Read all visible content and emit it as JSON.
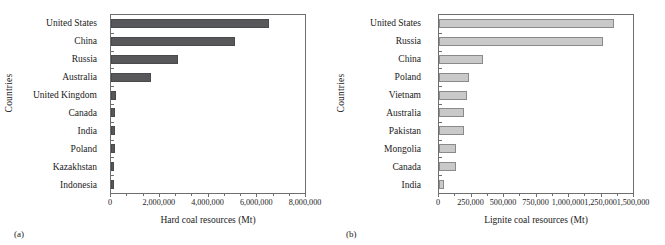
{
  "figure": {
    "panels": [
      {
        "tag": "(a)",
        "ylabel": "Countries",
        "xlabel": "Hard coal resources (Mt)"
      },
      {
        "tag": "(b)",
        "ylabel": "Countries",
        "xlabel": "Lignite coal resources (Mt)"
      }
    ]
  },
  "chart_data": [
    {
      "type": "bar",
      "orientation": "horizontal",
      "title": "",
      "xlabel": "Hard coal resources (Mt)",
      "ylabel": "Countries",
      "xlim": [
        0,
        8000000
      ],
      "xticks": [
        0,
        2000000,
        4000000,
        6000000,
        8000000
      ],
      "xticklabels": [
        "0",
        "2,000,000",
        "4,000,000",
        "6,000,000",
        "8,000,000"
      ],
      "grid": false,
      "legend": null,
      "bar_color": "#58585a",
      "categories": [
        "United States",
        "China",
        "Russia",
        "Australia",
        "United Kingdom",
        "Canada",
        "India",
        "Poland",
        "Kazakhstan",
        "Indonesia"
      ],
      "values": [
        6500000,
        5100000,
        2750000,
        1650000,
        190000,
        170000,
        165000,
        160000,
        140000,
        120000
      ]
    },
    {
      "type": "bar",
      "orientation": "horizontal",
      "title": "",
      "xlabel": "Lignite coal resources (Mt)",
      "ylabel": "Countries",
      "xlim": [
        0,
        1500000
      ],
      "xticks": [
        0,
        250000,
        500000,
        750000,
        1000000,
        1250000,
        1500000
      ],
      "xticklabels": [
        "0",
        "250,000",
        "500,000",
        "750,000",
        "1,000,000",
        "1,250,000",
        "1,500,000"
      ],
      "grid": false,
      "legend": null,
      "bar_color": "#c9c9c9",
      "categories": [
        "United States",
        "Russia",
        "China",
        "Poland",
        "Vietnam",
        "Australia",
        "Pakistan",
        "Mongolia",
        "Canada",
        "India"
      ],
      "values": [
        1350000,
        1270000,
        340000,
        230000,
        215000,
        195000,
        190000,
        135000,
        130000,
        35000
      ]
    }
  ]
}
